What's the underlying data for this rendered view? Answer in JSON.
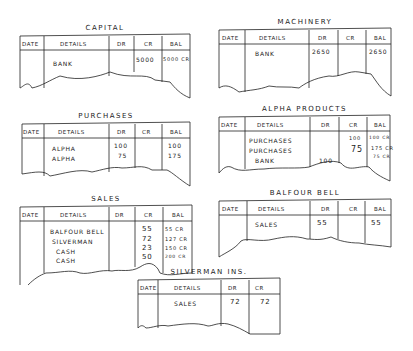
{
  "headers": {
    "date": "DATE",
    "details": "DETAILS",
    "dr": "DR",
    "cr": "CR",
    "bal": "BAL"
  },
  "ledgers": [
    {
      "title": "CAPITAL",
      "rows": [
        {
          "details": "BANK",
          "dr": "",
          "cr": "5000",
          "bal": "5000 CR"
        }
      ]
    },
    {
      "title": "MACHINERY",
      "rows": [
        {
          "details": "BANK",
          "dr": "2650",
          "cr": "",
          "bal": "2650"
        }
      ]
    },
    {
      "title": "PURCHASES",
      "rows": [
        {
          "details": "ALPHA",
          "dr": "100",
          "cr": "",
          "bal": "100"
        },
        {
          "details": "ALPHA",
          "dr": "75",
          "cr": "",
          "bal": "175"
        }
      ]
    },
    {
      "title": "ALPHA PRODUCTS",
      "rows": [
        {
          "details": "PURCHASES",
          "dr": "",
          "cr": "100",
          "bal": "100 CR"
        },
        {
          "details": "PURCHASES",
          "dr": "",
          "cr": "75",
          "bal": "175 CR"
        },
        {
          "details": "BANK",
          "dr": "100",
          "cr": "",
          "bal": "75 CR"
        }
      ]
    },
    {
      "title": "SALES",
      "rows": [
        {
          "details": "BALFOUR BELL",
          "dr": "",
          "cr": "55",
          "bal": "55 CR"
        },
        {
          "details": "SILVERMAN",
          "dr": "",
          "cr": "72",
          "bal": "127 CR"
        },
        {
          "details": "CASH",
          "dr": "",
          "cr": "23",
          "bal": "150 CR"
        },
        {
          "details": "CASH",
          "dr": "",
          "cr": "50",
          "bal": "200 CR"
        }
      ]
    },
    {
      "title": "BALFOUR BELL",
      "rows": [
        {
          "details": "SALES",
          "dr": "55",
          "cr": "",
          "bal": "55"
        }
      ]
    },
    {
      "title": "SILVERMAN INS.",
      "rows": [
        {
          "details": "SALES",
          "dr": "72",
          "cr": "",
          "bal": "72"
        }
      ]
    }
  ]
}
